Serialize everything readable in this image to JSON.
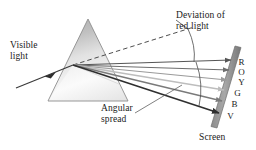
{
  "figure": {
    "background_color": "#ffffff",
    "width": 256,
    "height": 150
  },
  "labels": {
    "visible_light": "Visible\nlight",
    "deviation": "Deviation of\nred light",
    "angular_spread": "Angular\nspread",
    "screen": "Screen"
  },
  "spectrum": {
    "letters": [
      "R",
      "O",
      "Y",
      "G",
      "B",
      "V"
    ],
    "names": [
      "Red",
      "Orange",
      "Yellow",
      "Green",
      "Blue",
      "Violet"
    ]
  },
  "colors": {
    "ink": "#1a1a1a",
    "prism_top": "#b9b9b9",
    "prism_bottom": "#f4f4f4",
    "prism_edge": "#8d8d8d",
    "screen_face": "#9b9b9b",
    "screen_edge": "#6f6f6f",
    "ray_incident": "#3a3a3a",
    "ray_shades": [
      "#555555",
      "#6d6d6d",
      "#9a9a9a",
      "#c2c2c2",
      "#7a7a7a",
      "#2f2f2f"
    ],
    "dashed_line": "#3a3a3a",
    "leader_line": "#555555"
  },
  "geometry": {
    "prism_apex": [
      88,
      19
    ],
    "prism_base_left": [
      48,
      101
    ],
    "prism_base_right": [
      128,
      101
    ],
    "entry_point": [
      73,
      65
    ],
    "screen_top": [
      238,
      48
    ],
    "screen_bottom": [
      212,
      127
    ]
  }
}
